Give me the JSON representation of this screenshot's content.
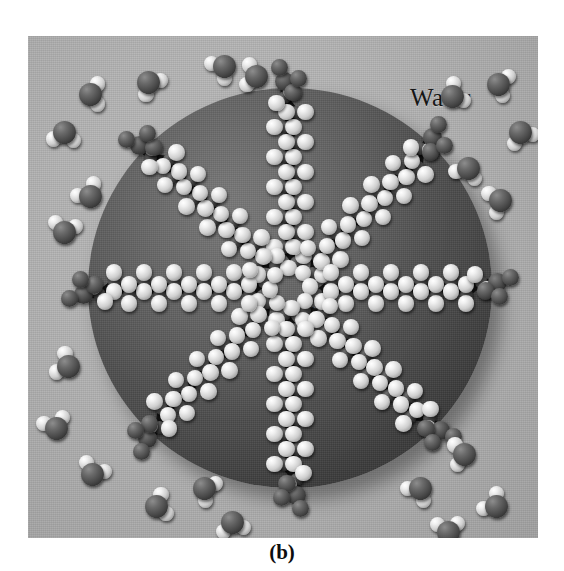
{
  "figure": {
    "caption": "(b)",
    "type": "molecular illustration",
    "labels": {
      "water": "Water",
      "oil": "Oil"
    },
    "colors": {
      "background": "#ffffff",
      "water_phase": "#b4b4b4",
      "oil_droplet": "#4e4e4e",
      "oil_droplet_highlight": "#6a6a6a",
      "oil_droplet_shadow": "#2e2e2e",
      "hydrogen_atom": "#f0f0f0",
      "carbon_atom": "#3a3a3a",
      "oxygen_atom": "#494949",
      "head_group": "#3f3f3f",
      "bond": "#141414",
      "label_text": "#161616",
      "caption_text": "#0d0d0d"
    },
    "panel": {
      "x": 28,
      "y": 36,
      "width": 510,
      "height": 502
    },
    "droplet": {
      "center_x": 262,
      "center_y": 252,
      "radius_x": 202,
      "radius_y": 200
    }
  },
  "chart_data": {
    "type": "diagram",
    "title": "(b)",
    "annotations": [
      "Water",
      "Oil"
    ],
    "surfactant_count": 8,
    "surfactant_chain_carbons": 12,
    "water_molecule_count": 22,
    "series": [
      {
        "name": "surfactants",
        "description": "Hydrocarbon tails point inward into the oil core; polar head groups face outward into water.",
        "values": [
          {
            "index": 1,
            "angle_deg": 270,
            "label": "top"
          },
          {
            "index": 2,
            "angle_deg": 315,
            "label": "upper-right"
          },
          {
            "index": 3,
            "angle_deg": 0,
            "label": "right"
          },
          {
            "index": 4,
            "angle_deg": 45,
            "label": "lower-right"
          },
          {
            "index": 5,
            "angle_deg": 90,
            "label": "bottom"
          },
          {
            "index": 6,
            "angle_deg": 135,
            "label": "lower-left"
          },
          {
            "index": 7,
            "angle_deg": 180,
            "label": "left"
          },
          {
            "index": 8,
            "angle_deg": 225,
            "label": "upper-left"
          }
        ]
      },
      {
        "name": "water molecules",
        "description": "Free H2O molecules dispersed through the continuous aqueous phase surrounding the droplet.",
        "positions": [
          [
            62,
            58
          ],
          [
            120,
            46
          ],
          [
            36,
            96
          ],
          [
            196,
            30
          ],
          [
            228,
            40
          ],
          [
            62,
            160
          ],
          [
            36,
            196
          ],
          [
            424,
            60
          ],
          [
            470,
            48
          ],
          [
            492,
            96
          ],
          [
            440,
            132
          ],
          [
            472,
            164
          ],
          [
            40,
            330
          ],
          [
            28,
            392
          ],
          [
            64,
            438
          ],
          [
            128,
            470
          ],
          [
            176,
            452
          ],
          [
            204,
            486
          ],
          [
            392,
            452
          ],
          [
            436,
            418
          ],
          [
            468,
            470
          ],
          [
            420,
            496
          ]
        ]
      }
    ],
    "legend_position": "none",
    "grid": false
  }
}
